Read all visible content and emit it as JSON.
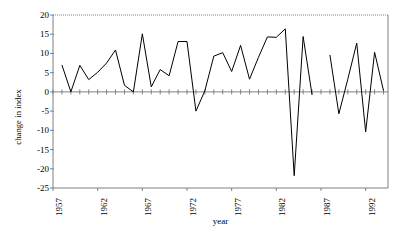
{
  "chart_data": {
    "type": "line",
    "title": "",
    "xlabel": "year",
    "ylabel": "change in index",
    "xlim": [
      1957,
      1994.5
    ],
    "ylim": [
      -25,
      20
    ],
    "ytick_values": [
      20,
      15,
      10,
      5,
      0,
      -5,
      -10,
      -15,
      -20,
      -25
    ],
    "ytick_labels": [
      "20",
      "15",
      "10",
      "5",
      "0",
      "-5",
      "-10",
      "-15",
      "-20",
      "-25"
    ],
    "xtick_values": [
      1957,
      1962,
      1967,
      1972,
      1977,
      1982,
      1987,
      1992
    ],
    "xtick_labels": [
      "1957",
      "1962",
      "1967",
      "1972",
      "1977",
      "1982",
      "1987",
      "1992"
    ],
    "minor_xticks_every": 1,
    "grid": false,
    "legend": false,
    "zero_line": true,
    "line_color": "#000000",
    "frame_color": "#808080",
    "series": [
      {
        "name": "change in index",
        "x": [
          1958,
          1959,
          1960,
          1961,
          1962,
          1963,
          1964,
          1965,
          1966,
          1967,
          1968,
          1969,
          1970,
          1971,
          1972,
          1973,
          1974,
          1975,
          1976,
          1977,
          1978,
          1979,
          1980,
          1981,
          1982,
          1983,
          1984,
          1985,
          1986
        ],
        "values": [
          7.0,
          0.0,
          6.9,
          3.2,
          5.1,
          7.5,
          10.9,
          1.7,
          0.0,
          15.1,
          1.3,
          5.8,
          4.2,
          13.1,
          13.1,
          -5.0,
          0.3,
          9.3,
          10.2,
          5.3,
          12.1,
          3.3,
          9.0,
          14.3,
          14.2,
          16.4,
          -21.8,
          14.4,
          -0.8
        ],
        "gap_after": 1986
      },
      {
        "name": "change in index (continued)",
        "x": [
          1988,
          1989,
          1990,
          1991,
          1992,
          1993,
          1994
        ],
        "values": [
          9.6,
          -5.7,
          3.3,
          12.7,
          -10.4,
          10.3,
          0.3
        ]
      }
    ]
  },
  "axis": {
    "ylabel_text": "change in index",
    "xlabel_text": "year"
  }
}
